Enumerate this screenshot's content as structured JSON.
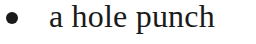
{
  "list": {
    "items": [
      {
        "bullet": "•",
        "text": "a hole punch"
      }
    ]
  }
}
